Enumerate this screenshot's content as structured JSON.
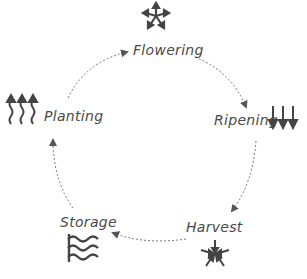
{
  "diagram": {
    "type": "cycle",
    "style": "hand-drawn pencil sketch",
    "stroke_color": "#555555",
    "background": "#ffffff",
    "nodes": [
      {
        "label": "Flowering",
        "icon": "star-arrows-outward-icon"
      },
      {
        "label": "Ripening",
        "icon": "down-arrows-icon"
      },
      {
        "label": "Harvest",
        "icon": "arrows-converging-center-icon"
      },
      {
        "label": "Storage",
        "icon": "wavy-lines-icon"
      },
      {
        "label": "Planting",
        "icon": "wavy-up-arrows-icon"
      }
    ],
    "edges": [
      {
        "from": "Planting",
        "to": "Flowering"
      },
      {
        "from": "Flowering",
        "to": "Ripening"
      },
      {
        "from": "Ripening",
        "to": "Harvest"
      },
      {
        "from": "Harvest",
        "to": "Storage"
      },
      {
        "from": "Storage",
        "to": "Planting"
      }
    ]
  }
}
